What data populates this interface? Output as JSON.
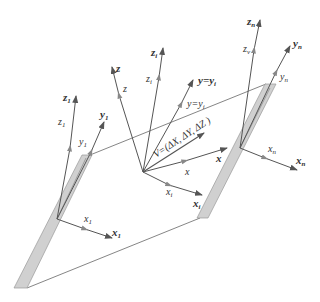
{
  "colors": {
    "line": "#555555",
    "plate_fill": "#d0d0d0",
    "plate_stroke": "#888888",
    "text": "#333333"
  },
  "labels": {
    "frame1": {
      "z_bold": "z",
      "z_sub": "1",
      "z_light": "z",
      "z_light_sub": "1",
      "y_bold": "y",
      "y_sub": "1",
      "y_light": "y",
      "y_light_sub": "1",
      "x_bold": "x",
      "x_sub": "1",
      "x_light": "x",
      "x_light_sub": "1"
    },
    "center": {
      "z_bold": "z",
      "z_light": "z",
      "zi_bold": "z",
      "zi_sub": "i",
      "zi_light": "z",
      "zi_light_sub": "i",
      "y_eq_bold": "y=y",
      "y_eq_sub": "i",
      "y_eq_light": "y=y",
      "y_eq_light_sub": "i",
      "x_bold": "x",
      "x_light": "x",
      "xi_bold": "x",
      "xi_sub": "i",
      "xi_light": "x",
      "xi_light_sub": "i"
    },
    "vector": "V=(ΔX, ΔY, ΔZ )",
    "framen": {
      "z_bold": "z",
      "z_sub": "n",
      "z_light": "z",
      "z_light_sub": "v",
      "y_bold": "y",
      "y_sub": "n",
      "y_light": "y",
      "y_light_sub": "n",
      "x_bold": "x",
      "x_sub": "n",
      "x_light": "x",
      "x_light_sub": "n"
    }
  }
}
